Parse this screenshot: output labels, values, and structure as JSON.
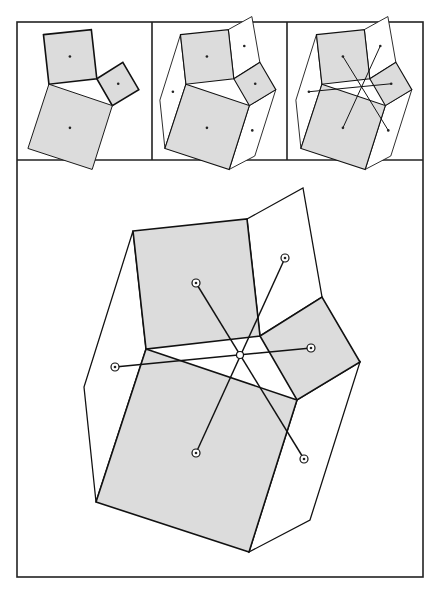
{
  "figure": {
    "title": "",
    "colors": {
      "square_fill": "#dcdcdc",
      "outline": "#111111",
      "background": "#ffffff"
    },
    "panels": [
      {
        "id": "panel-1",
        "label": "three squares on a triangle",
        "shows": [
          "squares",
          "square-centers"
        ]
      },
      {
        "id": "panel-2",
        "label": "quadrilaterals filling the gaps",
        "shows": [
          "squares",
          "quads",
          "all-centers"
        ]
      },
      {
        "id": "panel-3",
        "label": "center segments",
        "shows": [
          "squares",
          "quads",
          "center-segments"
        ]
      },
      {
        "id": "panel-main",
        "label": "enlarged construction",
        "shows": [
          "squares",
          "quads",
          "center-segments",
          "ring-markers",
          "concurrency-point"
        ]
      }
    ],
    "regions": {
      "squares": [
        "top-square",
        "right-square",
        "bottom-square"
      ],
      "quads": [
        "upper-right-quad",
        "left-quad",
        "lower-right-quad"
      ],
      "triangle": "central-triangle"
    },
    "segments": [
      {
        "from": "top-square-center",
        "to": "lower-right-quad-center"
      },
      {
        "from": "upper-right-quad-center",
        "to": "bottom-square-center"
      },
      {
        "from": "left-quad-center",
        "to": "right-square-center"
      }
    ]
  }
}
